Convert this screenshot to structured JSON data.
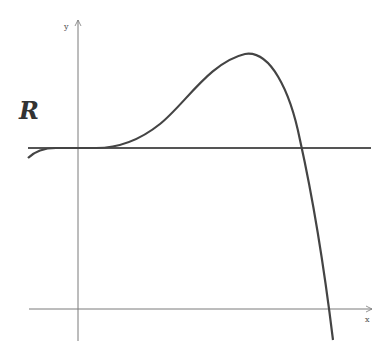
{
  "diagram": {
    "region_label": "R",
    "axis_labels": {
      "x": "x",
      "y": "y"
    },
    "colors": {
      "axis": "#7a7a7a",
      "curve": "#444444",
      "line": "#555555",
      "background": "#ffffff"
    }
  }
}
